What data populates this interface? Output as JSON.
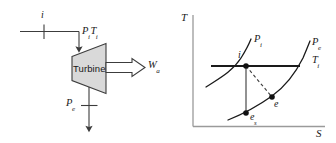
{
  "figure": {
    "background_color": "#ffffff",
    "line_color": "#3c3c3c",
    "heavy_line_color": "#1a1a1a",
    "fill_color": "#d9d9d9",
    "text_color": "#1a1a1a"
  },
  "schematic": {
    "name": "turbine-schematic",
    "device_label": "Turbine",
    "inlet": {
      "state_label": "i",
      "property_label_pressure": "P",
      "property_label_pressure_sub": "i",
      "property_label_temperature": "T",
      "property_label_temperature_sub": "i"
    },
    "outlet": {
      "property_label_pressure": "P",
      "property_label_pressure_sub": "e"
    },
    "work": {
      "label": "W",
      "label_sub": "a"
    }
  },
  "ts_diagram": {
    "name": "temperature-entropy-diagram",
    "axis_y_label": "T",
    "axis_x_label": "S",
    "curves": [
      {
        "name": "isobar-inlet-pressure",
        "label": "P",
        "label_sub": "i"
      },
      {
        "name": "isobar-exit-pressure",
        "label": "P",
        "label_sub": "e"
      }
    ],
    "isotherm": {
      "name": "isotherm-inlet-temperature",
      "label": "T",
      "label_sub": "i"
    },
    "states": [
      {
        "name": "state-point-i",
        "label": "i",
        "label_sub": "",
        "x": 246,
        "y": 66
      },
      {
        "name": "state-point-e",
        "label": "e",
        "label_sub": "",
        "x": 272,
        "y": 97
      },
      {
        "name": "state-point-es",
        "label": "e",
        "label_sub": "s",
        "x": 246,
        "y": 113
      }
    ],
    "process_lines": [
      {
        "name": "isentropic-process-line",
        "style": "solid",
        "from": "state-point-i",
        "to": "state-point-es"
      },
      {
        "name": "actual-process-line",
        "style": "dashed",
        "from": "state-point-i",
        "to": "state-point-e"
      }
    ]
  }
}
